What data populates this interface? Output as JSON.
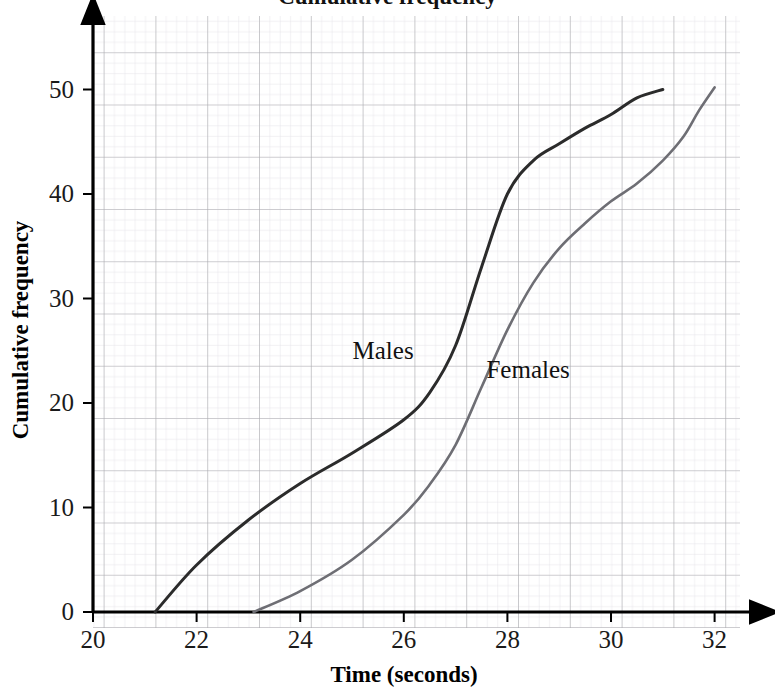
{
  "figure": {
    "background_color": "#ffffff",
    "partial_title": "Cumulative frequency",
    "grid": {
      "major_color": "#a9a9ad",
      "minor_color": "#d9d6e0",
      "visible": true,
      "minor_per_major": 5
    },
    "axis_color": "#000000"
  },
  "axes": {
    "x": {
      "title": "Time (seconds)",
      "ticks": [
        "20",
        "22",
        "24",
        "26",
        "28",
        "30",
        "32"
      ],
      "tick_values": [
        20,
        22,
        24,
        26,
        28,
        30,
        32
      ],
      "min": 20,
      "max": 32
    },
    "y": {
      "title": "Cumulative frequency",
      "ticks": [
        "0",
        "10",
        "20",
        "30",
        "40",
        "50"
      ],
      "tick_values": [
        0,
        10,
        20,
        30,
        40,
        50
      ],
      "min": 0,
      "max": 52
    }
  },
  "annotations": [
    {
      "text": "Males",
      "x": 25.6,
      "y": 24.2,
      "color": "#111111"
    },
    {
      "text": "Females",
      "x": 28.4,
      "y": 22.4,
      "color": "#111111"
    }
  ],
  "chart_data": {
    "type": "line",
    "title": "Cumulative frequency",
    "xlabel": "Time (seconds)",
    "ylabel": "Cumulative frequency",
    "xlim": [
      20,
      32
    ],
    "ylim": [
      0,
      52
    ],
    "grid": true,
    "legend_position": "inline-annotations",
    "series": [
      {
        "name": "Males",
        "color": "#2b2b2b",
        "width": 3.0,
        "points": [
          [
            21.2,
            0
          ],
          [
            22.0,
            4.5
          ],
          [
            23.0,
            8.8
          ],
          [
            24.0,
            12.3
          ],
          [
            25.0,
            15.2
          ],
          [
            26.0,
            18.4
          ],
          [
            26.5,
            21.0
          ],
          [
            27.0,
            25.5
          ],
          [
            27.5,
            33.0
          ],
          [
            28.0,
            40.0
          ],
          [
            28.5,
            43.2
          ],
          [
            29.0,
            44.8
          ],
          [
            29.5,
            46.3
          ],
          [
            30.0,
            47.6
          ],
          [
            30.5,
            49.2
          ],
          [
            31.0,
            50.0
          ]
        ]
      },
      {
        "name": "Females",
        "color": "#6e6e74",
        "width": 2.6,
        "points": [
          [
            23.1,
            0
          ],
          [
            24.0,
            2.0
          ],
          [
            25.0,
            5.0
          ],
          [
            26.0,
            9.3
          ],
          [
            26.5,
            12.2
          ],
          [
            27.0,
            16.0
          ],
          [
            27.5,
            21.5
          ],
          [
            28.0,
            27.0
          ],
          [
            28.5,
            31.5
          ],
          [
            29.0,
            34.8
          ],
          [
            29.5,
            37.2
          ],
          [
            30.0,
            39.3
          ],
          [
            30.5,
            41.0
          ],
          [
            31.0,
            43.2
          ],
          [
            31.4,
            45.5
          ],
          [
            31.7,
            48.0
          ],
          [
            32.0,
            50.2
          ]
        ]
      }
    ]
  }
}
